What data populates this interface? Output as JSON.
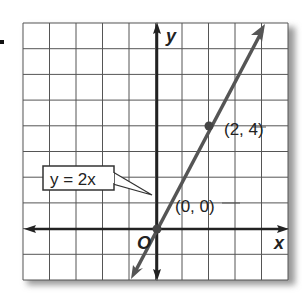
{
  "figure": {
    "bullet": "■",
    "grid": {
      "cols": 10,
      "rows": 10,
      "x_range": [
        -5,
        5
      ],
      "y_range": [
        -2,
        8
      ]
    },
    "axes": {
      "x_label": "x",
      "y_label": "y",
      "origin_label": "O"
    },
    "line": {
      "equation": "y = 2x",
      "slope": 2,
      "intercept": 0,
      "color": "#555555"
    },
    "points": [
      {
        "label": "(0, 0)",
        "x": 0,
        "y": 0
      },
      {
        "label": "(2, 4)",
        "x": 2,
        "y": 4
      }
    ],
    "callout_label": "y = 2x"
  },
  "chart_data": {
    "type": "line",
    "title": "",
    "xlabel": "x",
    "ylabel": "y",
    "series": [
      {
        "name": "y = 2x",
        "x": [
          -1,
          0,
          1,
          2,
          3,
          4
        ],
        "values": [
          -2,
          0,
          2,
          4,
          6,
          8
        ]
      }
    ],
    "annotations": [
      "(0, 0)",
      "(2, 4)",
      "y = 2x",
      "O"
    ],
    "xlim": [
      -5,
      5
    ],
    "ylim": [
      -2,
      8
    ],
    "grid": true
  }
}
